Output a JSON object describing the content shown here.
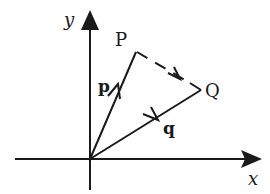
{
  "diagram": {
    "type": "vector-diagram",
    "axes": {
      "x_label": "x",
      "y_label": "y",
      "origin": [
        90,
        159
      ]
    },
    "points": {
      "P": {
        "label": "P",
        "pos": [
          136,
          52
        ]
      },
      "Q": {
        "label": "Q",
        "pos": [
          201,
          90
        ]
      }
    },
    "vectors": [
      {
        "name": "p",
        "label": "p",
        "from": "origin",
        "to": "P",
        "style": "solid"
      },
      {
        "name": "q",
        "label": "q",
        "from": "origin",
        "to": "Q",
        "style": "solid"
      },
      {
        "name": "PQ",
        "label": "",
        "from": "P",
        "to": "Q",
        "style": "dashed"
      }
    ],
    "colors": {
      "stroke": "#1a1a1a",
      "background": "#ffffff"
    }
  }
}
